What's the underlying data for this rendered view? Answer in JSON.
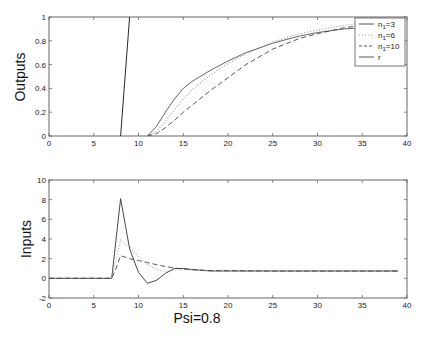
{
  "chart_data": [
    {
      "type": "line",
      "title": "",
      "xlabel": "",
      "ylabel": "Outputs",
      "xlim": [
        0,
        40
      ],
      "ylim": [
        0,
        1
      ],
      "xticks": [
        0,
        5,
        10,
        15,
        20,
        25,
        30,
        35,
        40
      ],
      "yticks": [
        0,
        0.2,
        0.4,
        0.6,
        0.8,
        1
      ],
      "ytick_labels": [
        "0",
        "0.2",
        "0.4",
        "0.6",
        "0.8",
        "1"
      ],
      "grid": false,
      "legend_position": "upper right",
      "series": [
        {
          "name": "n1=3",
          "style": "solid",
          "color": "#555555",
          "x": [
            11,
            12,
            13,
            14,
            15,
            16,
            18,
            20,
            22,
            25,
            28,
            30,
            33,
            35,
            38,
            39
          ],
          "y": [
            0,
            0.08,
            0.2,
            0.31,
            0.4,
            0.46,
            0.55,
            0.63,
            0.7,
            0.78,
            0.84,
            0.87,
            0.9,
            0.91,
            0.92,
            0.92
          ]
        },
        {
          "name": "n1=6",
          "style": "dotted",
          "color": "#999999",
          "x": [
            11,
            12,
            13,
            14,
            15,
            16,
            18,
            20,
            22,
            25,
            28,
            30,
            33,
            35,
            38,
            39
          ],
          "y": [
            0,
            0.04,
            0.12,
            0.22,
            0.31,
            0.39,
            0.51,
            0.61,
            0.69,
            0.79,
            0.86,
            0.89,
            0.93,
            0.95,
            0.96,
            0.96
          ]
        },
        {
          "name": "n1=10",
          "style": "dashed",
          "color": "#444444",
          "x": [
            11,
            12,
            13,
            14,
            15,
            16,
            18,
            20,
            22,
            25,
            28,
            30,
            33,
            35,
            38,
            39
          ],
          "y": [
            0,
            0.02,
            0.07,
            0.13,
            0.2,
            0.26,
            0.38,
            0.49,
            0.6,
            0.73,
            0.82,
            0.86,
            0.91,
            0.93,
            0.95,
            0.95
          ]
        },
        {
          "name": "r",
          "style": "solid",
          "color": "#111111",
          "x": [
            8,
            9
          ],
          "y": [
            0,
            1
          ]
        }
      ]
    },
    {
      "type": "line",
      "title": "",
      "xlabel": "Psi=0.8",
      "ylabel": "Inputs",
      "xlim": [
        0,
        40
      ],
      "ylim": [
        -2,
        10
      ],
      "xticks": [
        0,
        5,
        10,
        15,
        20,
        25,
        30,
        35,
        40
      ],
      "yticks": [
        -2,
        0,
        2,
        4,
        6,
        8,
        10
      ],
      "ytick_labels": [
        "-2",
        "0",
        "2",
        "4",
        "6",
        "8",
        "10"
      ],
      "grid": false,
      "series": [
        {
          "name": "n1=3",
          "style": "solid",
          "color": "#333333",
          "x": [
            0,
            7,
            8,
            9,
            10,
            11,
            12,
            13,
            14,
            15,
            16,
            18,
            20,
            25,
            30,
            35,
            39
          ],
          "y": [
            0,
            0,
            8.1,
            3.0,
            0.6,
            -0.5,
            -0.2,
            0.5,
            1.0,
            1.0,
            0.9,
            0.75,
            0.75,
            0.75,
            0.75,
            0.75,
            0.75
          ]
        },
        {
          "name": "n1=6",
          "style": "dotted",
          "color": "#aaaaaa",
          "x": [
            0,
            7,
            8,
            9,
            10,
            11,
            12,
            13,
            14,
            15,
            16,
            18,
            20,
            25,
            30,
            35,
            39
          ],
          "y": [
            0,
            0,
            3.9,
            3.2,
            2.2,
            1.4,
            0.9,
            0.7,
            0.8,
            0.9,
            0.85,
            0.78,
            0.75,
            0.75,
            0.75,
            0.75,
            0.75
          ]
        },
        {
          "name": "n1=10",
          "style": "dashed",
          "color": "#444444",
          "x": [
            0,
            7,
            7.5,
            8,
            9,
            10,
            11,
            12,
            13,
            14,
            15,
            16,
            18,
            20,
            25,
            30,
            35,
            39
          ],
          "y": [
            0,
            0,
            1.0,
            2.3,
            2.0,
            1.8,
            1.6,
            1.4,
            1.2,
            1.05,
            0.95,
            0.88,
            0.8,
            0.78,
            0.75,
            0.75,
            0.75,
            0.75
          ]
        }
      ]
    }
  ],
  "figure": {
    "top_ylabel": "Outputs",
    "bottom_ylabel": "Inputs",
    "bottom_xlabel": "Psi=0.8",
    "xtick_labels": [
      "0",
      "5",
      "10",
      "15",
      "20",
      "25",
      "30",
      "35",
      "40"
    ],
    "top_ytick_labels": [
      "0",
      "0.2",
      "0.4",
      "0.6",
      "0.8",
      "1"
    ],
    "bottom_ytick_labels": [
      "-2",
      "0",
      "2",
      "4",
      "6",
      "8",
      "10"
    ],
    "legend": {
      "entries": [
        {
          "label_main": "n",
          "label_sub": "1",
          "label_rest": "=3",
          "style": "solid"
        },
        {
          "label_main": "n",
          "label_sub": "1",
          "label_rest": "=6",
          "style": "dotted"
        },
        {
          "label_main": "n",
          "label_sub": "1",
          "label_rest": "=10",
          "style": "dashed"
        },
        {
          "label_main": "r",
          "label_sub": "",
          "label_rest": "",
          "style": "solid"
        }
      ]
    }
  }
}
